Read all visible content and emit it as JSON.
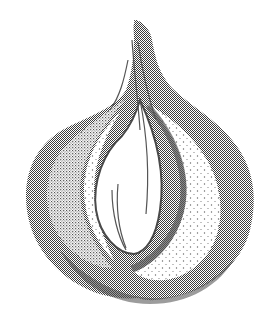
{
  "image": {
    "subject": "garlic bulb illustration",
    "style": "stippled halftone pen-and-ink",
    "width": 276,
    "height": 325,
    "colors": {
      "background": "#ffffff",
      "ink_dark": "#4a4a4a",
      "ink_mid": "#777777",
      "ink_light": "#bdbdbd"
    }
  }
}
